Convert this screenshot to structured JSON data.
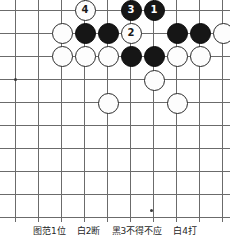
{
  "figure": {
    "board": {
      "cell_size": 23,
      "origin_x": 15,
      "origin_y": 10,
      "columns": 10,
      "rows": 10,
      "line_color": "#6b6b6b",
      "background_color": "#ffffff",
      "star_points": [
        {
          "col": 0,
          "row": 3
        },
        {
          "col": 5.9,
          "row": 8.7
        }
      ]
    },
    "stones": [
      {
        "name": "white-stone-4",
        "color": "white",
        "label": "4",
        "x": 85,
        "y": 10
      },
      {
        "name": "black-stone-3",
        "color": "black",
        "label": "3",
        "x": 131,
        "y": 10
      },
      {
        "name": "black-stone-1",
        "color": "black",
        "label": "1",
        "x": 154,
        "y": 10
      },
      {
        "name": "white-stone-r2c2",
        "color": "white",
        "label": "",
        "x": 62,
        "y": 33
      },
      {
        "name": "black-stone-r2c3",
        "color": "black",
        "label": "",
        "x": 85,
        "y": 33
      },
      {
        "name": "black-stone-r2c4",
        "color": "black",
        "label": "",
        "x": 108,
        "y": 33
      },
      {
        "name": "white-stone-2",
        "color": "white",
        "label": "2",
        "x": 131,
        "y": 33
      },
      {
        "name": "black-stone-r2c7",
        "color": "black",
        "label": "",
        "x": 177,
        "y": 33
      },
      {
        "name": "black-stone-r2c8",
        "color": "black",
        "label": "",
        "x": 200,
        "y": 33
      },
      {
        "name": "white-stone-r2c9",
        "color": "white",
        "label": "",
        "x": 223,
        "y": 33
      },
      {
        "name": "white-stone-r3c2",
        "color": "white",
        "label": "",
        "x": 62,
        "y": 56
      },
      {
        "name": "white-stone-r3c3",
        "color": "white",
        "label": "",
        "x": 85,
        "y": 56
      },
      {
        "name": "white-stone-r3c4",
        "color": "white",
        "label": "",
        "x": 108,
        "y": 56
      },
      {
        "name": "black-stone-r3c5",
        "color": "black",
        "label": "",
        "x": 131,
        "y": 56
      },
      {
        "name": "black-stone-r3c6",
        "color": "black",
        "label": "",
        "x": 154,
        "y": 56
      },
      {
        "name": "white-stone-r3c7",
        "color": "white",
        "label": "",
        "x": 177,
        "y": 56
      },
      {
        "name": "white-stone-r3c8",
        "color": "white",
        "label": "",
        "x": 200,
        "y": 56
      },
      {
        "name": "white-stone-r4c6",
        "color": "white",
        "label": "",
        "x": 154,
        "y": 80
      },
      {
        "name": "white-stone-r5c4",
        "color": "white",
        "label": "",
        "x": 108,
        "y": 103
      },
      {
        "name": "white-stone-r5c7",
        "color": "white",
        "label": "",
        "x": 177,
        "y": 103
      }
    ],
    "caption": [
      "图范1位",
      "白2断",
      "黑3不得不应",
      "白4打"
    ]
  }
}
